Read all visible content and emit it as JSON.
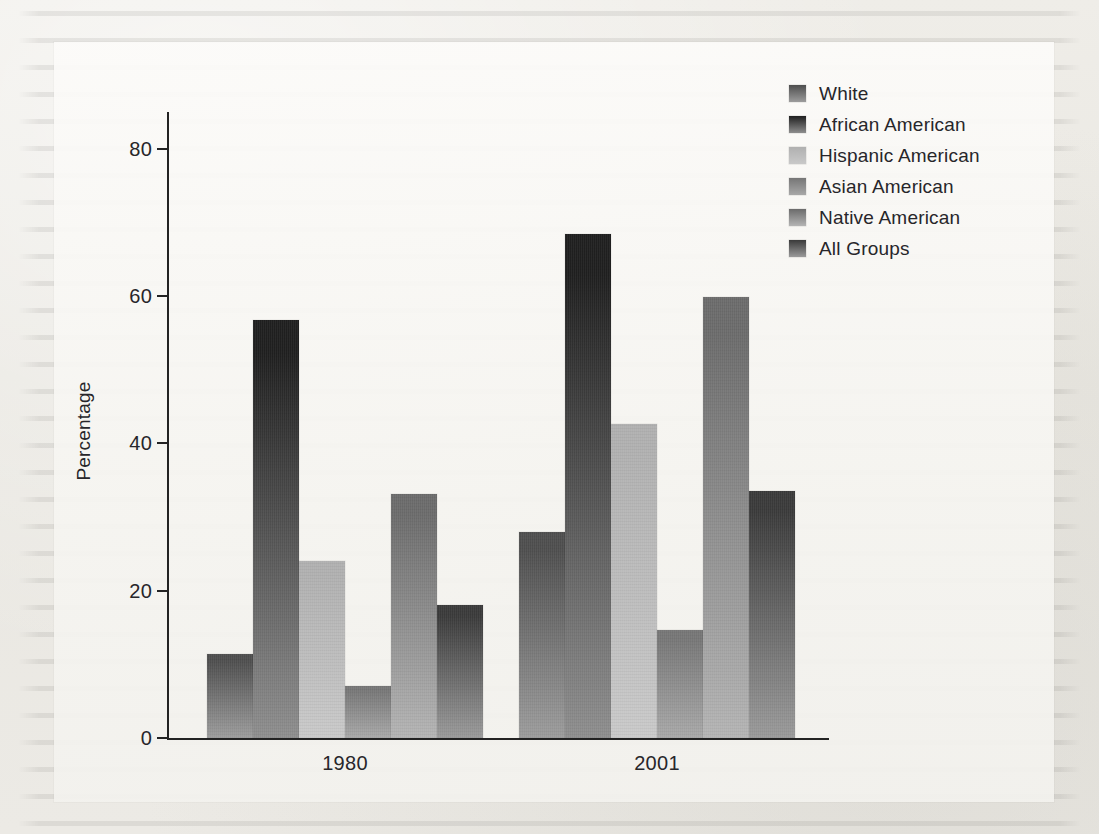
{
  "chart_data": {
    "type": "bar",
    "title": "",
    "xlabel": "",
    "ylabel": "Percentage",
    "categories": [
      "1980",
      "2001"
    ],
    "ylim": [
      0,
      85
    ],
    "yticks": [
      0,
      20,
      40,
      60,
      80
    ],
    "ytick_labels": [
      "0",
      "20",
      "40",
      "60",
      "80"
    ],
    "grid": false,
    "legend_position": "top-right",
    "series": [
      {
        "name": "White",
        "values": [
          11.4,
          28.0
        ],
        "color_top": "#4e4e4e",
        "color_bottom": "#9c9c9c"
      },
      {
        "name": "African American",
        "values": [
          56.7,
          68.4
        ],
        "color_top": "#1f1f1f",
        "color_bottom": "#8e8e8e"
      },
      {
        "name": "Hispanic American",
        "values": [
          24.1,
          42.7
        ],
        "color_top": "#b0b0b0",
        "color_bottom": "#c9c9c9"
      },
      {
        "name": "Asian American",
        "values": [
          7.0,
          14.6
        ],
        "color_top": "#767676",
        "color_bottom": "#a8a8a8"
      },
      {
        "name": "Native American",
        "values": [
          33.1,
          59.9
        ],
        "color_top": "#6b6b6b",
        "color_bottom": "#b4b4b4"
      },
      {
        "name": "All Groups",
        "values": [
          18.0,
          33.6
        ],
        "color_top": "#3a3a3a",
        "color_bottom": "#9a9a9a"
      }
    ]
  },
  "legend": {
    "items": [
      {
        "label": "White"
      },
      {
        "label": "African American"
      },
      {
        "label": "Hispanic American"
      },
      {
        "label": "Asian American"
      },
      {
        "label": "Native American"
      },
      {
        "label": "All Groups"
      }
    ]
  },
  "axes": {
    "y_title": "Percentage",
    "y_labels": [
      "80",
      "60",
      "40",
      "20",
      "0"
    ],
    "x_labels": [
      "1980",
      "2001"
    ]
  }
}
